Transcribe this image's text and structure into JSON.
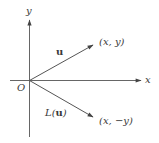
{
  "diagram": {
    "colors": {
      "axis": "#555555",
      "vector": "#555555",
      "text": "#3a3a3a",
      "background": "#ffffff"
    },
    "axes": {
      "x_label": "x",
      "y_label": "y",
      "origin_label": "O"
    },
    "vectors": [
      {
        "name": "u",
        "label": "u",
        "endpoint_label": "(x, y)"
      },
      {
        "name": "L(u)",
        "label_prefix": "L(",
        "label_bold": "u",
        "label_suffix": ")",
        "endpoint_label": "(x, −y)"
      }
    ]
  }
}
